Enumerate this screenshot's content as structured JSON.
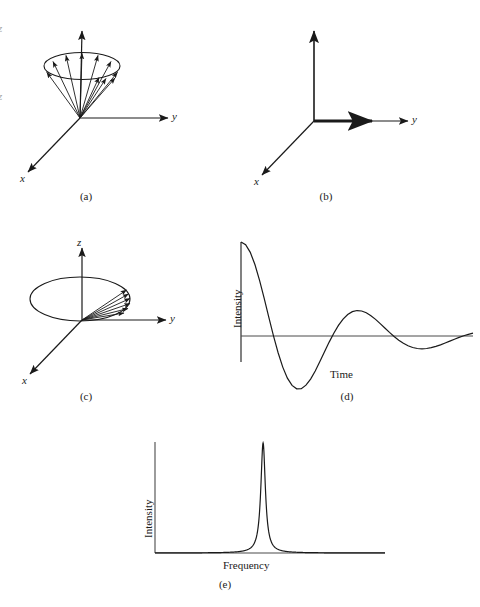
{
  "figure": {
    "kind": "nmr-fid-figure",
    "background": "#ffffff",
    "ink": "#1a1a1a"
  },
  "panels": [
    {
      "id": "a",
      "caption": "(a)",
      "axis_labels": {
        "x": "x",
        "y": "y",
        "z": ""
      },
      "description": "cone of spin vectors precessing about z"
    },
    {
      "id": "b",
      "caption": "(b)",
      "axis_labels": {
        "x": "x",
        "y": "y",
        "z": ""
      },
      "description": "net magnetization vector along +y"
    },
    {
      "id": "c",
      "caption": "(c)",
      "axis_labels": {
        "x": "x",
        "y": "y",
        "z": "z"
      },
      "description": "dephasing fan of vectors in the xy plane"
    },
    {
      "id": "d",
      "caption": "(d)",
      "axis_labels": {
        "x": "Time",
        "y": "Intensity"
      },
      "description": "free induction decay, damped oscillation"
    },
    {
      "id": "e",
      "caption": "(e)",
      "axis_labels": {
        "x": "Frequency",
        "y": "Intensity"
      },
      "description": "single sharp Lorentzian resonance line"
    }
  ],
  "edge_marks": {
    "top": "z",
    "bottom": "z"
  },
  "chart_data": [
    {
      "id": "d",
      "type": "line",
      "title": "",
      "xlabel": "Time",
      "ylabel": "Intensity",
      "xlim": [
        0,
        1
      ],
      "ylim": [
        -1,
        1
      ],
      "grid": false,
      "legend": "none",
      "curve": "damped_cosine",
      "amplitude": 1.0,
      "decay_constant": 3.2,
      "cycles": 4.6,
      "points_x": [
        0.0,
        0.02,
        0.04,
        0.06,
        0.08,
        0.1,
        0.12,
        0.14,
        0.16,
        0.18,
        0.2,
        0.22,
        0.24,
        0.26,
        0.28,
        0.3,
        0.32,
        0.34,
        0.36,
        0.38,
        0.4,
        0.42,
        0.44,
        0.46,
        0.48,
        0.5,
        0.52,
        0.54,
        0.56,
        0.58,
        0.6,
        0.62,
        0.64,
        0.66,
        0.68,
        0.7,
        0.72,
        0.74,
        0.76,
        0.78,
        0.8,
        0.82,
        0.84,
        0.86,
        0.88,
        0.9,
        0.92,
        0.94,
        0.96,
        0.98,
        1.0
      ],
      "points_y": [
        1.0,
        0.972,
        0.89,
        0.76,
        0.592,
        0.4,
        0.199,
        0.002,
        -0.178,
        -0.331,
        -0.448,
        -0.526,
        -0.562,
        -0.56,
        -0.523,
        -0.458,
        -0.372,
        -0.272,
        -0.168,
        -0.065,
        0.03,
        0.113,
        0.18,
        0.229,
        0.259,
        0.271,
        0.266,
        0.247,
        0.216,
        0.177,
        0.132,
        0.085,
        0.038,
        -0.006,
        -0.045,
        -0.078,
        -0.104,
        -0.122,
        -0.133,
        -0.136,
        -0.133,
        -0.124,
        -0.111,
        -0.094,
        -0.075,
        -0.055,
        -0.034,
        -0.015,
        0.003,
        0.018,
        0.03
      ]
    },
    {
      "id": "e",
      "type": "line",
      "title": "",
      "xlabel": "Frequency",
      "ylabel": "Intensity",
      "xlim": [
        0,
        1
      ],
      "ylim": [
        0,
        1
      ],
      "grid": false,
      "legend": "none",
      "curve": "lorentzian",
      "peak_center": 0.47,
      "peak_height": 1.0,
      "half_width": 0.012
    }
  ]
}
